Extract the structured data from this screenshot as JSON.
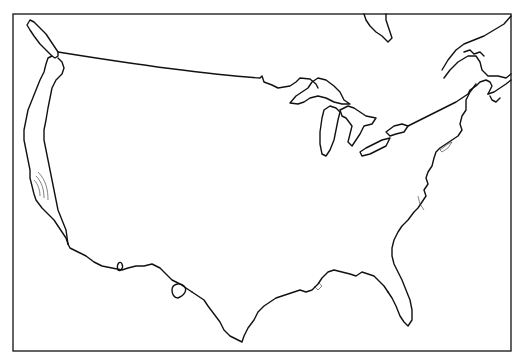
{
  "map": {
    "type": "outline-map",
    "region": "Contiguous United States",
    "frame": {
      "x": 13,
      "y": 14,
      "width": 498,
      "height": 337
    },
    "colors": {
      "background": "#ffffff",
      "line": "#111111"
    },
    "features": [
      "us-outline",
      "canada-border",
      "vancouver-island",
      "great-lakes",
      "gulf-coast",
      "atlantic-coast",
      "pacific-coast",
      "hudson-bay-edge",
      "nova-scotia",
      "gulf-of-st-lawrence"
    ]
  }
}
